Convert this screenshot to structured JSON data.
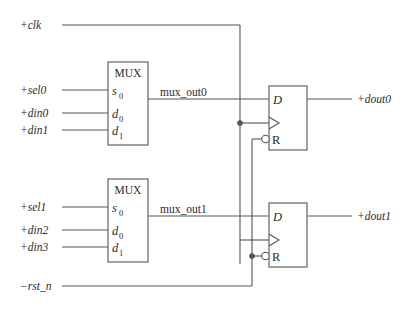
{
  "diagram": {
    "colors": {
      "wire": "#555555",
      "text": "#2b2b2b",
      "background": "#ffffff"
    }
  },
  "ports": {
    "inputs": [
      {
        "name": "clk-port",
        "label": "+clk"
      },
      {
        "name": "sel0-port",
        "label": "+sel0"
      },
      {
        "name": "din0-port",
        "label": "+din0"
      },
      {
        "name": "din1-port",
        "label": "+din1"
      },
      {
        "name": "sel1-port",
        "label": "+sel1"
      },
      {
        "name": "din2-port",
        "label": "+din2"
      },
      {
        "name": "din3-port",
        "label": "+din3"
      },
      {
        "name": "rst_n-port",
        "label": "−rst_n"
      }
    ],
    "outputs": [
      {
        "name": "dout0-port",
        "label": "+dout0"
      },
      {
        "name": "dout1-port",
        "label": "+dout1"
      }
    ]
  },
  "nets": [
    {
      "name": "mux-out0-net",
      "label": "mux_out0"
    },
    {
      "name": "mux-out1-net",
      "label": "mux_out1"
    }
  ],
  "blocks": {
    "mux0": {
      "title": "MUX",
      "pins": [
        {
          "base": "s",
          "sub": "0"
        },
        {
          "base": "d",
          "sub": "0"
        },
        {
          "base": "d",
          "sub": "1"
        }
      ]
    },
    "mux1": {
      "title": "MUX",
      "pins": [
        {
          "base": "s",
          "sub": "0"
        },
        {
          "base": "d",
          "sub": "0"
        },
        {
          "base": "d",
          "sub": "1"
        }
      ]
    },
    "dff0": {
      "d_pin": "D",
      "r_pin": "R"
    },
    "dff1": {
      "d_pin": "D",
      "r_pin": "R"
    }
  }
}
